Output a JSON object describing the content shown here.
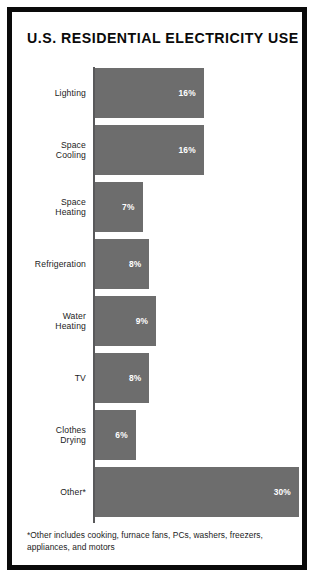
{
  "poster": {
    "title": "U.S. RESIDENTIAL ELECTRICITY USE",
    "footnote": "*Other includes cooking, furnace fans, PCs, washers, freezers, appliances, and motors",
    "frame_color": "#0a0a0a",
    "bar_color": "#6d6d6d",
    "axis_color": "#59595b",
    "value_text_color": "#ffffff",
    "label_text_color": "#1c1c1c",
    "background": "#ffffff"
  },
  "chart_data": {
    "type": "bar",
    "orientation": "horizontal",
    "title": "U.S. RESIDENTIAL ELECTRICITY USE",
    "xlabel": "",
    "ylabel": "",
    "xlim": [
      0,
      30
    ],
    "grid": false,
    "legend": false,
    "categories": [
      "Lighting",
      "Space Cooling",
      "Space Heating",
      "Refrigeration",
      "Water Heating",
      "TV",
      "Clothes Drying",
      "Other*"
    ],
    "values": [
      16,
      16,
      7,
      8,
      9,
      8,
      6,
      30
    ],
    "value_labels": [
      "16%",
      "16%",
      "7%",
      "8%",
      "9%",
      "8%",
      "6%",
      "30%"
    ],
    "annotations": [
      "*Other includes cooking, furnace fans, PCs, washers, freezers, appliances, and motors"
    ]
  },
  "rows": [
    {
      "label_line1": "Lighting",
      "label_line2": "",
      "value_label": "16%",
      "value": 16
    },
    {
      "label_line1": "Space",
      "label_line2": "Cooling",
      "value_label": "16%",
      "value": 16
    },
    {
      "label_line1": "Space",
      "label_line2": "Heating",
      "value_label": "7%",
      "value": 7
    },
    {
      "label_line1": "Refrigeration",
      "label_line2": "",
      "value_label": "8%",
      "value": 8
    },
    {
      "label_line1": "Water",
      "label_line2": "Heating",
      "value_label": "9%",
      "value": 9
    },
    {
      "label_line1": "TV",
      "label_line2": "",
      "value_label": "8%",
      "value": 8
    },
    {
      "label_line1": "Clothes",
      "label_line2": "Drying",
      "value_label": "6%",
      "value": 6
    },
    {
      "label_line1": "Other*",
      "label_line2": "",
      "value_label": "30%",
      "value": 30
    }
  ]
}
